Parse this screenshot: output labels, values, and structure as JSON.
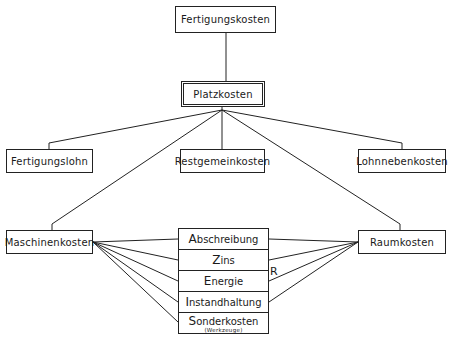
{
  "diagram": {
    "top": {
      "label": "Fertigungskosten"
    },
    "center": {
      "label": "Platzkosten"
    },
    "level2": [
      {
        "label": "Fertigungslohn"
      },
      {
        "label": "Restgemeinkosten"
      },
      {
        "label": "Lohnnebenkosten"
      }
    ],
    "left_cost": {
      "label": "Maschinenkosten"
    },
    "right_cost": {
      "label": "Raumkosten"
    },
    "components": [
      {
        "initial": "A",
        "rest": "bschreibung",
        "note": ""
      },
      {
        "initial": "Z",
        "rest": "ins",
        "note": ""
      },
      {
        "initial": "E",
        "rest": "nergie",
        "note": ""
      },
      {
        "initial": "I",
        "rest": "nstandhaltung",
        "note": ""
      },
      {
        "initial": "S",
        "rest": "onderkosten",
        "note": "(Werkzeuge)"
      }
    ],
    "r_label": "R"
  }
}
